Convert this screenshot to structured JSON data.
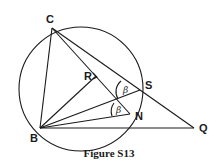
{
  "figure": {
    "caption": "Figure S13",
    "points": {
      "C": "C",
      "B": "B",
      "Q": "Q",
      "S": "S",
      "N": "N",
      "R": "R"
    },
    "angle_labels": {
      "angle_at_S": "β",
      "angle_at_N": "β"
    },
    "segments": [
      "CB",
      "CQ",
      "CN",
      "BQ",
      "BS",
      "BN",
      "BR"
    ],
    "shapes": [
      "circumcircle through C, B, S, N"
    ]
  }
}
